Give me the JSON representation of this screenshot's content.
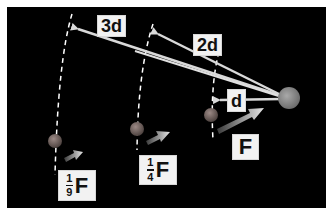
{
  "diagram": {
    "colors": {
      "background": "#ffffff",
      "panel": "#000000",
      "arrow": "#d9d9d9",
      "dashed_arc": "#ffffff",
      "big_sphere": "#8a8a8a",
      "small_sphere": "#7a6a66",
      "label_bg": "#f2f2f2",
      "label_text": "#111111"
    },
    "distance_labels": [
      {
        "id": "d1",
        "text": "d"
      },
      {
        "id": "d2",
        "text": "2d"
      },
      {
        "id": "d3",
        "text": "3d"
      }
    ],
    "force_labels": [
      {
        "id": "f1",
        "numerator": "",
        "denominator": "",
        "symbol": "F"
      },
      {
        "id": "f2",
        "numerator": "1",
        "denominator": "4",
        "symbol": "F"
      },
      {
        "id": "f3",
        "numerator": "1",
        "denominator": "9",
        "symbol": "F"
      }
    ]
  }
}
